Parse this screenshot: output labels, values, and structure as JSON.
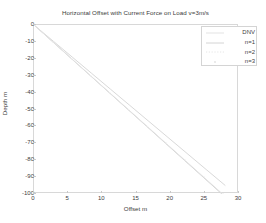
{
  "chart_data": {
    "type": "line",
    "title": "Horizontal Offset with Current Force on Load v=3m/s",
    "xlabel": "Offset m",
    "ylabel": "Depth m",
    "xlim": [
      0,
      30
    ],
    "ylim": [
      -100,
      0
    ],
    "xticks": [
      0,
      5,
      10,
      15,
      20,
      25,
      30
    ],
    "xticklabels": [
      "0",
      "5",
      "10",
      "15",
      "20",
      "25",
      "30"
    ],
    "yticks": [
      0,
      -10,
      -20,
      -30,
      -40,
      -50,
      -60,
      -70,
      -80,
      -90,
      -100
    ],
    "yticklabels": [
      "0",
      "-10",
      "-20",
      "-30",
      "-40",
      "-50",
      "-60",
      "-70",
      "-80",
      "-90",
      "-100"
    ],
    "grid": false,
    "legend_position": "upper right",
    "legend_entries": [
      "DNV",
      "n=1",
      "n=2",
      "n=3"
    ],
    "series": [
      {
        "name": "DNV",
        "style": "solid",
        "color": "#d9d9d9",
        "x": [
          0,
          2.8,
          5.6,
          8.4,
          11.2,
          14.0,
          16.8,
          19.6,
          22.4,
          25.2,
          28.0
        ],
        "y": [
          0,
          -9.5,
          -19.0,
          -28.5,
          -38.0,
          -47.5,
          -57.0,
          -66.5,
          -76.0,
          -85.5,
          -95.0
        ]
      },
      {
        "name": "n=1",
        "style": "solid",
        "color": "#cfcfcf",
        "x": [
          0,
          2.75,
          5.5,
          8.25,
          11.0,
          13.75,
          16.5,
          19.25,
          22.0,
          24.75,
          27.5
        ],
        "y": [
          0,
          -10.0,
          -20.0,
          -30.0,
          -40.0,
          -50.0,
          -60.0,
          -70.0,
          -80.0,
          -90.0,
          -100.0
        ]
      },
      {
        "name": "n=2",
        "style": "solid",
        "color": "#e3e3e3",
        "x": [
          0,
          2.76,
          5.52,
          8.28,
          11.04,
          13.8,
          16.56,
          19.32,
          22.08,
          24.84,
          27.6
        ],
        "y": [
          0,
          -10.0,
          -20.0,
          -30.0,
          -40.0,
          -50.0,
          -60.0,
          -70.0,
          -80.0,
          -90.0,
          -100.0
        ]
      },
      {
        "name": "n=3",
        "style": "markers",
        "color": "#ececec",
        "x": [
          0,
          2.77,
          5.54,
          8.31,
          11.08,
          13.85,
          16.62,
          19.39,
          22.16,
          24.93,
          27.7
        ],
        "y": [
          0,
          -10.0,
          -20.0,
          -30.0,
          -40.0,
          -50.0,
          -60.0,
          -70.0,
          -80.0,
          -90.0,
          -100.0
        ]
      }
    ]
  },
  "legend": {
    "items": [
      {
        "label": "DNV",
        "sample": "line",
        "color": "#dcdcdc"
      },
      {
        "label": "n=1",
        "sample": "line",
        "color": "#c9c9c9"
      },
      {
        "label": "n=2",
        "sample": "dotted",
        "color": "#e0e0e0"
      },
      {
        "label": "n=3",
        "sample": "marker",
        "color": "#e6e6e6"
      }
    ]
  }
}
